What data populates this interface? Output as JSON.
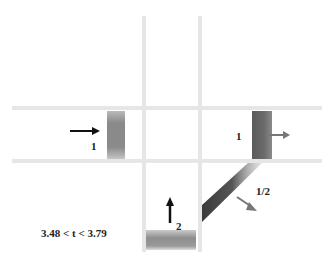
{
  "diagram": {
    "title": "",
    "time_range_label": "3.48 < t < 3.79",
    "channels": {
      "horizontal": [
        "top-horizontal-channel",
        "bottom-horizontal-channel"
      ],
      "vertical": [
        "left-vertical-channel",
        "right-vertical-channel"
      ]
    },
    "packets": [
      {
        "id": "left-packet",
        "label": "1",
        "direction": "right",
        "arrow_color": "#111111"
      },
      {
        "id": "right-packet",
        "label": "1",
        "direction": "right",
        "arrow_color": "#777777"
      },
      {
        "id": "bottom-packet",
        "label": "2",
        "direction": "up",
        "arrow_color": "#111111"
      },
      {
        "id": "diagonal-packet",
        "label": "1/2",
        "direction": "down-right",
        "arrow_color": "#777777"
      }
    ],
    "colors": {
      "channel": "#e6e6e6",
      "packet_dark": "#555555",
      "packet_light": "#9a9a9a"
    }
  }
}
